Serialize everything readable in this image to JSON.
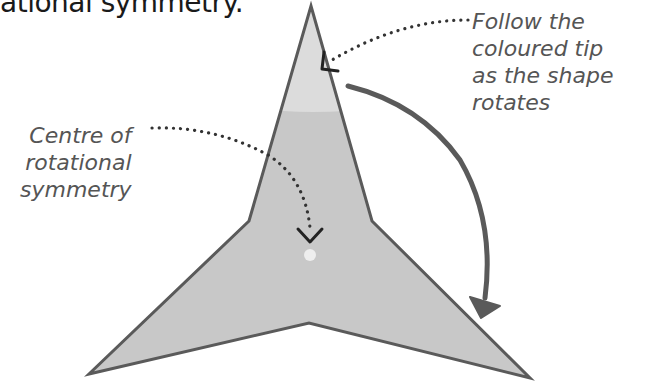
{
  "heading": {
    "partial_text": "ational symmetry."
  },
  "labels": {
    "centre": {
      "lines": [
        "Centre of",
        "rotational",
        "symmetry"
      ]
    },
    "tip": {
      "lines": [
        "Follow the",
        "coloured tip",
        "as the shape",
        "rotates"
      ]
    }
  },
  "shape": {
    "type": "three-pointed-star",
    "fill": "#c8c8c8",
    "tip_fill": "#dedede",
    "stroke": "#5a5a5a"
  },
  "centre_point": {
    "color": "#eeeeee"
  },
  "rotation_arrow": {
    "direction": "clockwise",
    "color": "#5a5a5a"
  },
  "colors": {
    "text": "#555555",
    "leader_dots": "#333333"
  }
}
